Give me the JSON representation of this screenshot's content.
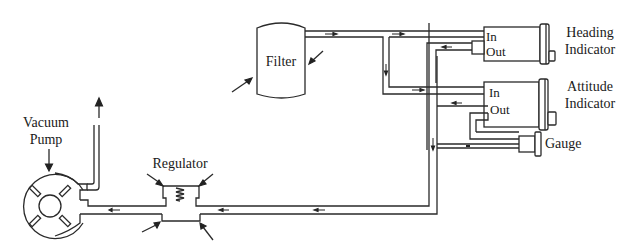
{
  "diagram": {
    "type": "vacuum-system-schematic",
    "colors": {
      "line": "#2a2a2a",
      "background": "#ffffff"
    },
    "labels": {
      "vacuum_pump_line1": "Vacuum",
      "vacuum_pump_line2": "Pump",
      "regulator": "Regulator",
      "filter": "Filter",
      "heading_line1": "Heading",
      "heading_line2": "Indicator",
      "attitude_line1": "Attitude",
      "attitude_line2": "Indicator",
      "gauge": "Gauge",
      "heading_in": "In",
      "heading_out": "Out",
      "attitude_in": "In",
      "attitude_out": "Out"
    },
    "components": [
      {
        "id": "vacuum-pump",
        "label": "Vacuum Pump"
      },
      {
        "id": "regulator",
        "label": "Regulator"
      },
      {
        "id": "filter",
        "label": "Filter"
      },
      {
        "id": "heading-indicator",
        "label": "Heading Indicator",
        "ports": [
          "In",
          "Out"
        ]
      },
      {
        "id": "attitude-indicator",
        "label": "Attitude Indicator",
        "ports": [
          "In",
          "Out"
        ]
      },
      {
        "id": "gauge",
        "label": "Gauge"
      }
    ],
    "flow": [
      "Filter -> Heading Indicator In",
      "Filter -> Attitude Indicator In",
      "Heading Indicator Out -> return line",
      "Attitude Indicator Out -> return line",
      "return line -> Regulator -> Vacuum Pump -> exhaust"
    ]
  }
}
